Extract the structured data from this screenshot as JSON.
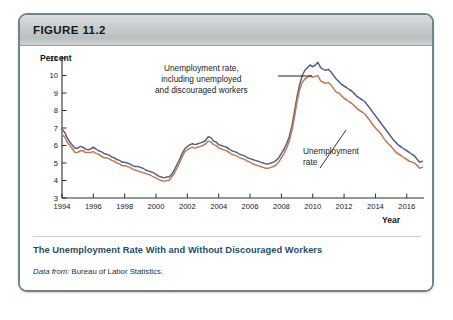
{
  "figure": {
    "label": "FIGURE 11.2",
    "caption": "The Unemployment Rate With and Without Discouraged Workers",
    "source_prefix": "Data from:",
    "source_text": "Bureau of Labor Statistics."
  },
  "annotations": {
    "u6": {
      "line1": "Unemployment rate,",
      "line2": "including unemployed",
      "line3": "and discouraged workers"
    },
    "u3": {
      "line1": "Unemployment",
      "line2": "rate"
    }
  },
  "colors": {
    "series_u6": "#5b5f8f",
    "series_u3": "#c5794d",
    "border": "#6d858f",
    "header_gray": "#c6cbcb",
    "caption_blue": "#1f4e66",
    "axis": "#2b3136"
  },
  "chart_data": {
    "type": "line",
    "title": "The Unemployment Rate With and Without Discouraged Workers",
    "xlabel": "Year",
    "ylabel": "Percent",
    "xlim": [
      1994,
      2017.1
    ],
    "ylim": [
      3,
      11
    ],
    "grid": false,
    "legend_position": "annotations-inline",
    "xticks": [
      1994,
      1996,
      1998,
      2000,
      2002,
      2004,
      2006,
      2008,
      2010,
      2012,
      2014,
      2016
    ],
    "xticklabels": [
      "1994",
      "1996",
      "1998",
      "2000",
      "2002",
      "2004",
      "2006",
      "2008",
      "2010",
      "2012",
      "2014",
      "2016"
    ],
    "yticks": [
      3,
      4,
      5,
      6,
      7,
      8,
      9,
      10,
      11
    ],
    "yticklabels": [
      "3",
      "4",
      "5",
      "6",
      "7",
      "8",
      "9",
      "10",
      "11"
    ],
    "series": [
      {
        "name": "Unemployment rate, including unemployed and discouraged workers",
        "color": "#5b5f8f",
        "x": [
          1994.0,
          1994.17,
          1994.33,
          1994.5,
          1994.67,
          1994.83,
          1995.0,
          1995.17,
          1995.33,
          1995.5,
          1995.67,
          1995.83,
          1996.0,
          1996.17,
          1996.33,
          1996.5,
          1996.67,
          1996.83,
          1997.0,
          1997.17,
          1997.33,
          1997.5,
          1997.67,
          1997.83,
          1998.0,
          1998.17,
          1998.33,
          1998.5,
          1998.67,
          1998.83,
          1999.0,
          1999.17,
          1999.33,
          1999.5,
          1999.67,
          1999.83,
          2000.0,
          2000.17,
          2000.33,
          2000.5,
          2000.67,
          2000.83,
          2001.0,
          2001.17,
          2001.33,
          2001.5,
          2001.67,
          2001.83,
          2002.0,
          2002.17,
          2002.33,
          2002.5,
          2002.67,
          2002.83,
          2003.0,
          2003.17,
          2003.33,
          2003.5,
          2003.67,
          2003.83,
          2004.0,
          2004.17,
          2004.33,
          2004.5,
          2004.67,
          2004.83,
          2005.0,
          2005.17,
          2005.33,
          2005.5,
          2005.67,
          2005.83,
          2006.0,
          2006.17,
          2006.33,
          2006.5,
          2006.67,
          2006.83,
          2007.0,
          2007.17,
          2007.33,
          2007.5,
          2007.67,
          2007.83,
          2008.0,
          2008.17,
          2008.33,
          2008.5,
          2008.67,
          2008.83,
          2009.0,
          2009.17,
          2009.33,
          2009.5,
          2009.67,
          2009.83,
          2010.0,
          2010.17,
          2010.33,
          2010.5,
          2010.67,
          2010.83,
          2011.0,
          2011.17,
          2011.33,
          2011.5,
          2011.67,
          2011.83,
          2012.0,
          2012.17,
          2012.33,
          2012.5,
          2012.67,
          2012.83,
          2013.0,
          2013.17,
          2013.33,
          2013.5,
          2013.67,
          2013.83,
          2014.0,
          2014.17,
          2014.33,
          2014.5,
          2014.67,
          2014.83,
          2015.0,
          2015.17,
          2015.33,
          2015.5,
          2015.67,
          2015.83,
          2016.0,
          2016.17,
          2016.33,
          2016.5,
          2016.67,
          2016.83,
          2017.0
        ],
        "y": [
          6.95,
          6.75,
          6.45,
          6.2,
          6.0,
          5.85,
          5.85,
          5.95,
          5.9,
          5.8,
          5.75,
          5.8,
          5.9,
          5.8,
          5.7,
          5.65,
          5.55,
          5.5,
          5.45,
          5.35,
          5.3,
          5.2,
          5.15,
          5.05,
          5.05,
          5.0,
          4.95,
          4.85,
          4.8,
          4.8,
          4.75,
          4.7,
          4.6,
          4.55,
          4.5,
          4.45,
          4.35,
          4.25,
          4.2,
          4.15,
          4.2,
          4.2,
          4.35,
          4.6,
          4.9,
          5.2,
          5.55,
          5.8,
          5.95,
          6.05,
          6.1,
          6.05,
          6.1,
          6.15,
          6.2,
          6.3,
          6.5,
          6.45,
          6.25,
          6.2,
          6.05,
          6.0,
          5.95,
          5.9,
          5.8,
          5.7,
          5.65,
          5.6,
          5.5,
          5.45,
          5.4,
          5.3,
          5.25,
          5.2,
          5.15,
          5.1,
          5.05,
          5.0,
          4.95,
          4.95,
          5.0,
          5.05,
          5.15,
          5.3,
          5.55,
          5.8,
          6.1,
          6.5,
          7.1,
          7.9,
          8.8,
          9.5,
          10.0,
          10.3,
          10.45,
          10.6,
          10.5,
          10.6,
          10.75,
          10.45,
          10.35,
          10.3,
          10.35,
          10.2,
          10.0,
          9.8,
          9.65,
          9.5,
          9.4,
          9.3,
          9.2,
          9.1,
          8.95,
          8.8,
          8.7,
          8.6,
          8.5,
          8.3,
          8.1,
          7.9,
          7.7,
          7.5,
          7.3,
          7.1,
          6.9,
          6.7,
          6.5,
          6.3,
          6.15,
          6.0,
          5.9,
          5.8,
          5.7,
          5.6,
          5.5,
          5.4,
          5.2,
          5.05,
          5.1
        ],
        "description": "U-6 style broader measure; starts ~7.0 in 1994, troughs ~4.2 in 2000, peaks ~10.75 in 2010, ends ~5.1"
      },
      {
        "name": "Unemployment rate",
        "color": "#c5794d",
        "x": [
          1994.0,
          1994.17,
          1994.33,
          1994.5,
          1994.67,
          1994.83,
          1995.0,
          1995.17,
          1995.33,
          1995.5,
          1995.67,
          1995.83,
          1996.0,
          1996.17,
          1996.33,
          1996.5,
          1996.67,
          1996.83,
          1997.0,
          1997.17,
          1997.33,
          1997.5,
          1997.67,
          1997.83,
          1998.0,
          1998.17,
          1998.33,
          1998.5,
          1998.67,
          1998.83,
          1999.0,
          1999.17,
          1999.33,
          1999.5,
          1999.67,
          1999.83,
          2000.0,
          2000.17,
          2000.33,
          2000.5,
          2000.67,
          2000.83,
          2001.0,
          2001.17,
          2001.33,
          2001.5,
          2001.67,
          2001.83,
          2002.0,
          2002.17,
          2002.33,
          2002.5,
          2002.67,
          2002.83,
          2003.0,
          2003.17,
          2003.33,
          2003.5,
          2003.67,
          2003.83,
          2004.0,
          2004.17,
          2004.33,
          2004.5,
          2004.67,
          2004.83,
          2005.0,
          2005.17,
          2005.33,
          2005.5,
          2005.67,
          2005.83,
          2006.0,
          2006.17,
          2006.33,
          2006.5,
          2006.67,
          2006.83,
          2007.0,
          2007.17,
          2007.33,
          2007.5,
          2007.67,
          2007.83,
          2008.0,
          2008.17,
          2008.33,
          2008.5,
          2008.67,
          2008.83,
          2009.0,
          2009.17,
          2009.33,
          2009.5,
          2009.67,
          2009.83,
          2010.0,
          2010.17,
          2010.33,
          2010.5,
          2010.67,
          2010.83,
          2011.0,
          2011.17,
          2011.33,
          2011.5,
          2011.67,
          2011.83,
          2012.0,
          2012.17,
          2012.33,
          2012.5,
          2012.67,
          2012.83,
          2013.0,
          2013.17,
          2013.33,
          2013.5,
          2013.67,
          2013.83,
          2014.0,
          2014.17,
          2014.33,
          2014.5,
          2014.67,
          2014.83,
          2015.0,
          2015.17,
          2015.33,
          2015.5,
          2015.67,
          2015.83,
          2016.0,
          2016.17,
          2016.33,
          2016.5,
          2016.67,
          2016.83,
          2017.0
        ],
        "y": [
          6.6,
          6.5,
          6.2,
          6.0,
          5.8,
          5.6,
          5.6,
          5.7,
          5.7,
          5.6,
          5.6,
          5.6,
          5.65,
          5.55,
          5.5,
          5.4,
          5.3,
          5.3,
          5.25,
          5.15,
          5.1,
          5.0,
          4.95,
          4.85,
          4.85,
          4.8,
          4.75,
          4.65,
          4.6,
          4.55,
          4.5,
          4.45,
          4.4,
          4.35,
          4.3,
          4.2,
          4.15,
          4.05,
          4.0,
          3.95,
          4.0,
          4.0,
          4.2,
          4.4,
          4.7,
          5.0,
          5.35,
          5.65,
          5.75,
          5.85,
          5.9,
          5.85,
          5.9,
          5.95,
          6.0,
          6.1,
          6.25,
          6.2,
          6.05,
          6.0,
          5.85,
          5.8,
          5.75,
          5.7,
          5.6,
          5.5,
          5.45,
          5.4,
          5.3,
          5.25,
          5.2,
          5.1,
          5.05,
          4.95,
          4.9,
          4.85,
          4.8,
          4.75,
          4.7,
          4.7,
          4.75,
          4.8,
          4.9,
          5.05,
          5.3,
          5.55,
          5.85,
          6.25,
          6.85,
          7.6,
          8.5,
          9.2,
          9.6,
          9.8,
          9.9,
          10.0,
          9.9,
          9.95,
          10.0,
          9.7,
          9.6,
          9.55,
          9.6,
          9.45,
          9.25,
          9.05,
          9.0,
          8.85,
          8.7,
          8.6,
          8.5,
          8.4,
          8.25,
          8.1,
          8.0,
          7.9,
          7.8,
          7.6,
          7.4,
          7.2,
          7.0,
          6.85,
          6.7,
          6.45,
          6.25,
          6.1,
          5.95,
          5.75,
          5.6,
          5.5,
          5.4,
          5.3,
          5.2,
          5.1,
          5.05,
          5.0,
          4.85,
          4.7,
          4.75
        ],
        "description": "Official U-3 unemployment rate; starts ~6.6 in 1994, troughs ~3.95 in 2000, peaks ~10.0 in 2010, ends ~4.75"
      }
    ]
  }
}
